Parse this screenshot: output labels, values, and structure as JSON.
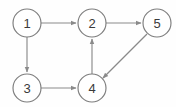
{
  "diagram": {
    "background_color": "#fefefe",
    "node_stroke_color": "#7d7d7d",
    "node_fill_color": "#ffffff",
    "edge_color": "#8a8a8a",
    "label_color": "#3a3a3a",
    "node_radius": 14,
    "nodes": [
      {
        "id": "1",
        "label": "1",
        "cx": 27,
        "cy": 23
      },
      {
        "id": "2",
        "label": "2",
        "cx": 92,
        "cy": 23
      },
      {
        "id": "5",
        "label": "5",
        "cx": 157,
        "cy": 23
      },
      {
        "id": "3",
        "label": "3",
        "cx": 27,
        "cy": 88
      },
      {
        "id": "4",
        "label": "4",
        "cx": 92,
        "cy": 88
      }
    ],
    "edges": [
      {
        "id": "edge-1-2",
        "from": "1",
        "to": "2",
        "directed": true,
        "x1": 41,
        "y1": 23,
        "x2": 76,
        "y2": 23
      },
      {
        "id": "edge-1-3",
        "from": "1",
        "to": "3",
        "directed": true,
        "x1": 27,
        "y1": 37,
        "x2": 27,
        "y2": 72
      },
      {
        "id": "edge-2-5",
        "from": "2",
        "to": "5",
        "directed": true,
        "x1": 106,
        "y1": 23,
        "x2": 141,
        "y2": 23
      },
      {
        "id": "edge-3-4",
        "from": "3",
        "to": "4",
        "directed": true,
        "x1": 41,
        "y1": 88,
        "x2": 76,
        "y2": 88
      },
      {
        "id": "edge-4-2",
        "from": "4",
        "to": "2",
        "directed": true,
        "x1": 92,
        "y1": 74,
        "x2": 92,
        "y2": 39
      },
      {
        "id": "edge-5-4",
        "from": "5",
        "to": "4",
        "directed": true,
        "x1": 147,
        "y1": 34,
        "x2": 103,
        "y2": 78
      }
    ]
  }
}
